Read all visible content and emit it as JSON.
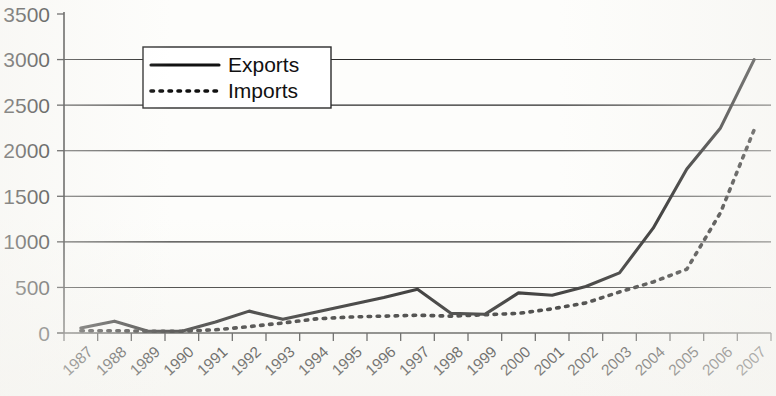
{
  "chart_data": {
    "type": "line",
    "title": "",
    "xlabel": "",
    "ylabel": "",
    "ylim": [
      0,
      3500
    ],
    "ytick_step": 500,
    "grid": true,
    "legend_position": "upper-left-inside",
    "categories": [
      "1987",
      "1988",
      "1989",
      "1990",
      "1991",
      "1992",
      "1993",
      "1994",
      "1995",
      "1996",
      "1997",
      "1998",
      "1999",
      "2000",
      "2001",
      "2002",
      "2003",
      "2004",
      "2005",
      "2006",
      "2007"
    ],
    "yticks": [
      "0",
      "500",
      "1000",
      "1500",
      "2000",
      "2500",
      "3000",
      "3500"
    ],
    "series": [
      {
        "name": "Exports",
        "style": "solid",
        "color": "#111111",
        "values": [
          55,
          130,
          20,
          20,
          120,
          240,
          150,
          230,
          310,
          390,
          480,
          215,
          205,
          440,
          415,
          510,
          660,
          1150,
          1800,
          2250,
          3000
        ]
      },
      {
        "name": "Imports",
        "style": "dotted",
        "color": "#111111",
        "values": [
          25,
          25,
          20,
          20,
          35,
          70,
          110,
          155,
          175,
          185,
          195,
          185,
          200,
          215,
          265,
          330,
          450,
          560,
          700,
          1320,
          2230
        ]
      }
    ]
  },
  "legend": {
    "entries": [
      {
        "label": "Exports"
      },
      {
        "label": "Imports"
      }
    ]
  },
  "axes": {
    "y_max_label": "3500",
    "y_min_label": "0"
  }
}
